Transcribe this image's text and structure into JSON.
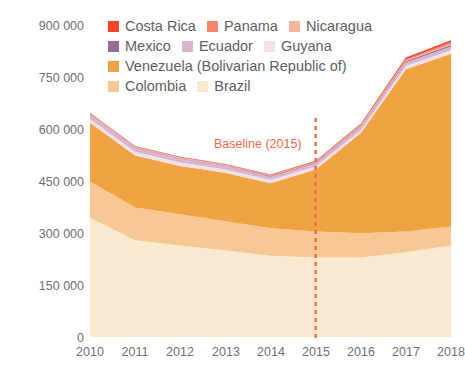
{
  "chart_data": {
    "type": "area",
    "title": "",
    "subtitle": "",
    "xlabel": "",
    "ylabel": "",
    "x": [
      2010,
      2011,
      2012,
      2013,
      2014,
      2015,
      2016,
      2017,
      2018
    ],
    "categories": [
      "2010",
      "2011",
      "2012",
      "2013",
      "2014",
      "2015",
      "2016",
      "2017",
      "2018"
    ],
    "xtick_labels": [
      "2010",
      "2011",
      "2012",
      "2013",
      "2014",
      "2015",
      "2016",
      "2017",
      "2018"
    ],
    "ytick_labels": [
      "0",
      "150 000",
      "300 000",
      "450 000",
      "600 000",
      "750 000",
      "900 000"
    ],
    "ytick_values": [
      0,
      150000,
      300000,
      450000,
      600000,
      750000,
      900000
    ],
    "ylim": [
      0,
      900000
    ],
    "xlim": [
      2010,
      2018
    ],
    "grid": false,
    "legend_position": "top",
    "stacked": true,
    "stack_order_bottom_to_top": [
      "Brazil",
      "Colombia",
      "Venezuela (Bolivarian Republic of)",
      "Guyana",
      "Ecuador",
      "Mexico",
      "Nicaragua",
      "Panama",
      "Costa Rica"
    ],
    "series": [
      {
        "name": "Costa Rica",
        "color": "#f4442a",
        "values": [
          1500,
          1400,
          1400,
          1500,
          1600,
          1800,
          2600,
          4500,
          6000
        ]
      },
      {
        "name": "Panama",
        "color": "#f4866a",
        "values": [
          1500,
          1500,
          1500,
          1600,
          1700,
          1900,
          2600,
          4200,
          5500
        ]
      },
      {
        "name": "Nicaragua",
        "color": "#f6b49c",
        "values": [
          1200,
          1200,
          1200,
          1200,
          1200,
          1300,
          1600,
          2200,
          2600
        ]
      },
      {
        "name": "Mexico",
        "color": "#9a6a96",
        "values": [
          1500,
          1500,
          1500,
          1500,
          1600,
          1700,
          2200,
          3200,
          4000
        ]
      },
      {
        "name": "Ecuador",
        "color": "#d9b6d0",
        "values": [
          12000,
          11500,
          11000,
          10500,
          10000,
          9500,
          9500,
          10500,
          11500
        ]
      },
      {
        "name": "Guyana",
        "color": "#f3e0ea",
        "values": [
          11000,
          10500,
          10000,
          9500,
          9000,
          8500,
          8500,
          9000,
          9500
        ]
      },
      {
        "name": "Venezuela (Bolivarian Republic of)",
        "color": "#f0a343",
        "values": [
          170000,
          150000,
          140000,
          140000,
          130000,
          180000,
          290000,
          470000,
          500000
        ]
      },
      {
        "name": "Colombia",
        "color": "#f7c893",
        "values": [
          105000,
          95000,
          90000,
          85000,
          80000,
          75000,
          70000,
          60000,
          55000
        ]
      },
      {
        "name": "Brazil",
        "color": "#f7ead0",
        "values": [
          345000,
          280000,
          265000,
          250000,
          235000,
          230000,
          230000,
          245000,
          265000
        ]
      }
    ],
    "totals": [
      648700,
      551600,
      521600,
      501300,
      470100,
      509700,
      617000,
      808600,
      859600
    ],
    "annotations": [
      {
        "name": "baseline",
        "label": "Baseline (2015)",
        "x": 2015,
        "color": "#ef6b45",
        "line_style": "dashed"
      }
    ]
  },
  "legend": {
    "rows": [
      [
        {
          "label": "Costa Rica",
          "color": "#f4442a"
        },
        {
          "label": "Panama",
          "color": "#f4866a"
        },
        {
          "label": "Nicaragua",
          "color": "#f6b49c"
        }
      ],
      [
        {
          "label": "Mexico",
          "color": "#9a6a96"
        },
        {
          "label": "Ecuador",
          "color": "#d9b6d0"
        },
        {
          "label": "Guyana",
          "color": "#f3e0ea"
        }
      ],
      [
        {
          "label": "Venezuela (Bolivarian Republic of)",
          "color": "#f0a343"
        }
      ],
      [
        {
          "label": "Colombia",
          "color": "#f7c893"
        },
        {
          "label": "Brazil",
          "color": "#f7ead0"
        }
      ]
    ]
  },
  "colors": {
    "background": "#ffffff",
    "tick_text": "#6f6f6f",
    "legend_text": "#5f5f5f",
    "baseline": "#ef6b45"
  }
}
